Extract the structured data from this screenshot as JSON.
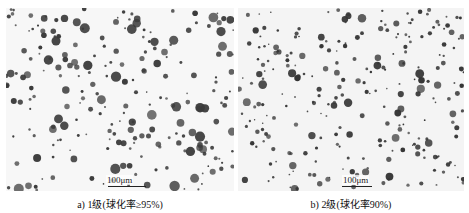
{
  "figure": {
    "panels": [
      {
        "id": "a",
        "caption": "a) 1级(球化率≥95%)",
        "scale_bar": "100μm",
        "dot_color": "#3a3a3a",
        "background": "#f7f7f7",
        "seed": 17,
        "count": 230
      },
      {
        "id": "b",
        "caption": "b) 2级(球化率90%)",
        "scale_bar": "100μm",
        "dot_color": "#353535",
        "background": "#f4f4f4",
        "seed": 53,
        "count": 260
      }
    ]
  }
}
